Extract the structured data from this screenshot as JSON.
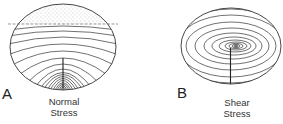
{
  "panels": [
    {
      "letter": "A",
      "caption_line1": "Normal",
      "caption_line2": "Stress",
      "description": "Ellipse with stippled top region above dashed line, nested arc contours converging to a crack at the bottom center"
    },
    {
      "letter": "B",
      "caption_line1": "Shear",
      "caption_line2": "Stress",
      "description": "Ellipse with concentric elliptical contours centered near the middle, crack extending to bottom"
    }
  ],
  "colors": {
    "line": "#333333",
    "stipple": "#999999",
    "background": "#ffffff"
  }
}
